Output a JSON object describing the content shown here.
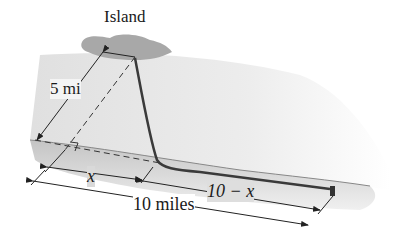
{
  "labels": {
    "island": "Island",
    "distance_to_island": "5 mi",
    "x": "x",
    "remaining": "10 − x",
    "total": "10 miles"
  },
  "colors": {
    "cable": "#3a3a3a",
    "dimension_line": "#222222",
    "island": "#9a9a9a",
    "shore": "#bdbdbd",
    "water": "#e6e6e6"
  }
}
